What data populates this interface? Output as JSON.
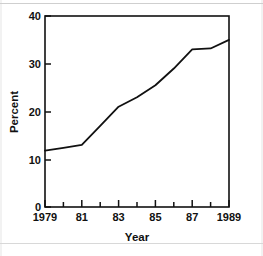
{
  "chart_data": {
    "type": "line",
    "title": "",
    "subtitle": "",
    "xlabel": "Year",
    "ylabel": "Percent",
    "x": [
      1979,
      1980,
      1981,
      1982,
      1983,
      1984,
      1985,
      1986,
      1987,
      1988,
      1989
    ],
    "values": [
      11.8,
      12.4,
      13.0,
      17.0,
      21.0,
      23.0,
      25.5,
      29.0,
      33.0,
      33.2,
      35.0
    ],
    "series": [
      {
        "name": "Percent",
        "values": [
          11.8,
          12.4,
          13.0,
          17.0,
          21.0,
          23.0,
          25.5,
          29.0,
          33.0,
          33.2,
          35.0
        ]
      }
    ],
    "xlim": [
      1979,
      1989
    ],
    "ylim": [
      0,
      40
    ],
    "x_tick_values": [
      1979,
      1980,
      1981,
      1982,
      1983,
      1984,
      1985,
      1986,
      1987,
      1988,
      1989
    ],
    "x_tick_labels": [
      "1979",
      "",
      "81",
      "",
      "83",
      "",
      "85",
      "",
      "87",
      "",
      "1989"
    ],
    "y_ticks": [
      0,
      10,
      20,
      30,
      40
    ],
    "y_tick_labels": [
      "0",
      "10",
      "20",
      "30",
      "40"
    ],
    "grid": false,
    "legend": false,
    "legend_position": "none",
    "line_color": "#111111",
    "background_color": "#ffffff",
    "axis_color": "#111111"
  },
  "axes": {
    "y_label": "Percent",
    "x_label": "Year",
    "y_tick_labels": [
      "40",
      "30",
      "20",
      "10",
      "0"
    ],
    "x_tick_labels": [
      "1979",
      "81",
      "83",
      "85",
      "87",
      "1989"
    ]
  }
}
